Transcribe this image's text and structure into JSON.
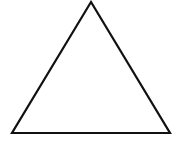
{
  "diagram": {
    "shape": "triangle",
    "kind": "equilateral-outline",
    "vertices": [
      [
        91,
        2
      ],
      [
        12,
        133
      ],
      [
        170,
        133
      ]
    ],
    "stroke_color": "#111111",
    "stroke_width": 2.2,
    "fill_color": "none",
    "background_color": "#ffffff"
  }
}
